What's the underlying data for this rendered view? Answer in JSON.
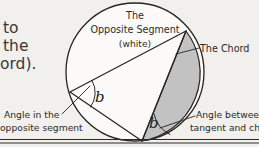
{
  "figure": {
    "background_color": "#f2f0ec",
    "ink_color": "#262522",
    "shaded_segment_color": "#c2c2c2",
    "white_segment_color": "#fbfaf8"
  },
  "cutoff_text": {
    "line1": "to",
    "line2": "the",
    "line3": "ord)."
  },
  "labels": {
    "opposite_segment": {
      "line1": "The",
      "line2": "Opposite Segment",
      "line3": "(white)"
    },
    "chord": "The Chord",
    "angle_in_opposite_segment": {
      "line1": "Angle in the",
      "line2": "opposite segment"
    },
    "angle_between_tangent_and_chord": {
      "line1": "Angle between",
      "line2": "tangent and chord"
    }
  },
  "angle_markers": {
    "upper": "b",
    "lower": "b"
  },
  "geometry": {
    "circle": {
      "cx": 135,
      "cy": 72,
      "r": 69
    },
    "chord_endpoints": [
      {
        "x": 186,
        "y": 31
      },
      {
        "x": 142,
        "y": 141
      }
    ],
    "inscribed_vertex": {
      "x": 70,
      "y": 92
    },
    "tangent_point": {
      "x": 142,
      "y": 141
    },
    "tangent_y": 139
  }
}
